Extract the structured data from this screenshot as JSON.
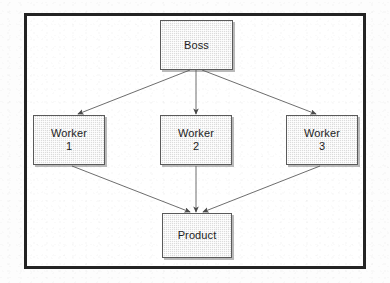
{
  "diagram": {
    "frame": {
      "border_color": "#232323"
    },
    "node_style": {
      "fill": "#dcdcdc",
      "border": "#5a5a5a",
      "text_color": "#1d1d1d"
    },
    "edge_color": "#6e6e6e",
    "nodes": [
      {
        "id": "boss",
        "label": "Boss",
        "sub": "",
        "x": 160,
        "y": 20,
        "w": 73,
        "h": 50
      },
      {
        "id": "worker1",
        "label": "Worker",
        "sub": "1",
        "x": 33,
        "y": 115,
        "w": 72,
        "h": 50
      },
      {
        "id": "worker2",
        "label": "Worker",
        "sub": "2",
        "x": 160,
        "y": 115,
        "w": 72,
        "h": 50
      },
      {
        "id": "worker3",
        "label": "Worker",
        "sub": "3",
        "x": 286,
        "y": 115,
        "w": 72,
        "h": 50
      },
      {
        "id": "product",
        "label": "Product",
        "sub": "",
        "x": 162,
        "y": 213,
        "w": 70,
        "h": 45
      }
    ],
    "edges": [
      {
        "from": "boss",
        "to": "worker1",
        "x1": 190,
        "y1": 70,
        "x2": 78,
        "y2": 114
      },
      {
        "from": "boss",
        "to": "worker2",
        "x1": 196,
        "y1": 70,
        "x2": 196,
        "y2": 114
      },
      {
        "from": "boss",
        "to": "worker3",
        "x1": 202,
        "y1": 70,
        "x2": 316,
        "y2": 114
      },
      {
        "from": "worker1",
        "to": "product",
        "x1": 72,
        "y1": 166,
        "x2": 190,
        "y2": 212
      },
      {
        "from": "worker2",
        "to": "product",
        "x1": 196,
        "y1": 166,
        "x2": 196,
        "y2": 212
      },
      {
        "from": "worker3",
        "to": "product",
        "x1": 320,
        "y1": 166,
        "x2": 203,
        "y2": 212
      }
    ]
  }
}
